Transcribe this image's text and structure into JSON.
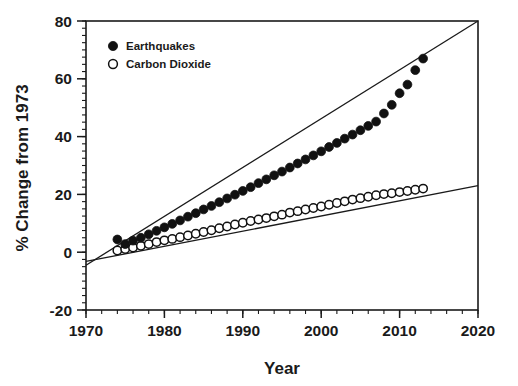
{
  "chart_data": {
    "type": "scatter",
    "title": "",
    "xlabel": "Year",
    "ylabel": "% Change from 1973",
    "xlim": [
      1970,
      2020
    ],
    "ylim": [
      -20,
      80
    ],
    "xticks": [
      1970,
      1980,
      1990,
      2000,
      2010,
      2020
    ],
    "xticklabels": [
      "1970",
      "1980",
      "1990",
      "2000",
      "2010",
      "2020"
    ],
    "yticks": [
      -20,
      0,
      20,
      40,
      60,
      80
    ],
    "yticklabels": [
      "-20",
      "0",
      "20",
      "40",
      "60",
      "80"
    ],
    "x_minor_interval": 2,
    "y_minor_interval": 2.5,
    "grid": false,
    "legend_position": "upper-left-inside",
    "series": [
      {
        "name": "Earthquakes",
        "marker": "filled-circle",
        "color": "#111111",
        "x": [
          1974,
          1975,
          1976,
          1977,
          1978,
          1979,
          1980,
          1981,
          1982,
          1983,
          1984,
          1985,
          1986,
          1987,
          1988,
          1989,
          1990,
          1991,
          1992,
          1993,
          1994,
          1995,
          1996,
          1997,
          1998,
          1999,
          2000,
          2001,
          2002,
          2003,
          2004,
          2005,
          2006,
          2007,
          2008,
          2009,
          2010,
          2011,
          2012,
          2013
        ],
        "values": [
          4.4,
          2.8,
          4.0,
          5.0,
          6.2,
          7.4,
          8.6,
          9.8,
          11.0,
          12.3,
          13.5,
          14.8,
          16.0,
          17.3,
          18.6,
          19.9,
          21.2,
          22.5,
          23.9,
          25.2,
          26.6,
          27.9,
          29.3,
          30.7,
          32.1,
          33.5,
          34.9,
          36.4,
          37.8,
          39.3,
          40.7,
          42.2,
          43.7,
          45.2,
          48.0,
          51.0,
          55.0,
          58.0,
          63.0,
          67.0
        ],
        "trend": {
          "x": [
            1970,
            2020
          ],
          "y": [
            -4.5,
            80.0
          ]
        }
      },
      {
        "name": "Carbon Dioxide",
        "marker": "open-circle",
        "color": "#111111",
        "x": [
          1974,
          1975,
          1976,
          1977,
          1978,
          1979,
          1980,
          1981,
          1982,
          1983,
          1984,
          1985,
          1986,
          1987,
          1988,
          1989,
          1990,
          1991,
          1992,
          1993,
          1994,
          1995,
          1996,
          1997,
          1998,
          1999,
          2000,
          2001,
          2002,
          2003,
          2004,
          2005,
          2006,
          2007,
          2008,
          2009,
          2010,
          2011,
          2012,
          2013
        ],
        "values": [
          0.6,
          1.1,
          1.6,
          2.2,
          2.8,
          3.5,
          4.1,
          4.6,
          5.2,
          5.8,
          6.4,
          7.0,
          7.6,
          8.3,
          8.9,
          9.6,
          10.2,
          10.8,
          11.3,
          11.8,
          12.4,
          13.0,
          13.7,
          14.2,
          14.8,
          15.3,
          15.8,
          16.4,
          17.0,
          17.6,
          18.2,
          18.7,
          19.2,
          19.7,
          20.1,
          20.4,
          20.8,
          21.2,
          21.6,
          22.0
        ],
        "trend": {
          "x": [
            1970,
            2020
          ],
          "y": [
            -3.2,
            23.0
          ]
        }
      }
    ],
    "legend": [
      {
        "label": "Earthquakes",
        "marker": "filled-circle"
      },
      {
        "label": "Carbon Dioxide",
        "marker": "open-circle"
      }
    ]
  }
}
